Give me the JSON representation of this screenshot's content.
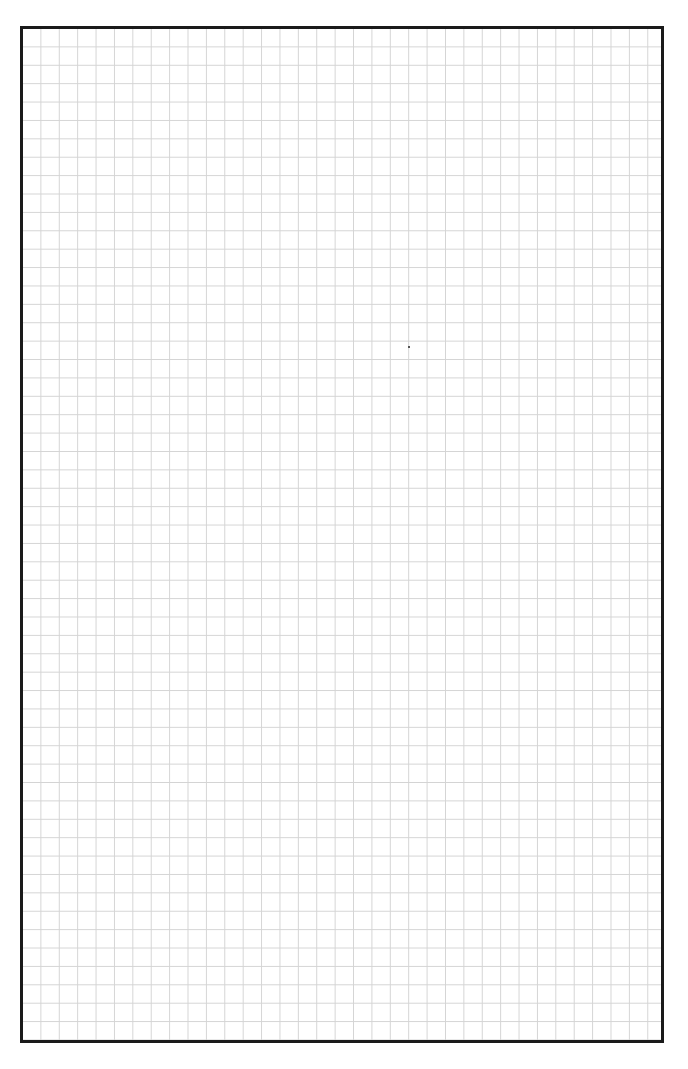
{
  "page": {
    "type": "grid-paper",
    "grid": {
      "cell_size_px": 18.4,
      "columns": 35,
      "rows": 55,
      "line_color": "#d4d4d4"
    },
    "border_color": "#1a1a1a",
    "background": "#ffffff"
  }
}
